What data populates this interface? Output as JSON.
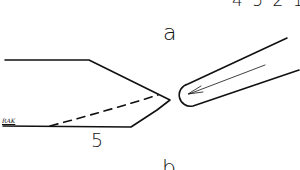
{
  "figure": {
    "labels": {
      "top_number": "4 5 2 1",
      "part_a": "a",
      "part_b": "b",
      "reference_5": "5",
      "signature": "RAK"
    },
    "colors": {
      "line": "#111111",
      "background": "#ffffff"
    }
  }
}
